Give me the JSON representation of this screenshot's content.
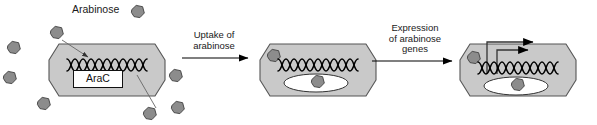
{
  "figure": {
    "legend_label": "Arabinose",
    "legend_marker": "hexagon-icon"
  },
  "colors": {
    "cell_fill": "#c9c9c9",
    "cell_stroke": "#555555",
    "molecule_fill": "#8c8c8c",
    "molecule_stroke": "#4a4a4a",
    "dna_stroke": "#000000",
    "protein_fill": "#ffffff",
    "text": "#1a1a1a",
    "arrow": "#000000",
    "leader_line": "#666666",
    "background": "#ffffff"
  },
  "steps": [
    {
      "id": "step-1",
      "arrow_label": "",
      "cell": {
        "dna": "dna-helix-icon",
        "protein_label": "AraC",
        "protein_bound": false,
        "transcription": false
      }
    },
    {
      "id": "step-2",
      "arrow_label": "Uptake of\narabinose",
      "arrow_label_lines": [
        "Uptake of",
        "arabinose"
      ],
      "cell": {
        "dna": "dna-helix-icon",
        "protein_label": "",
        "protein_bound": true,
        "transcription": false
      }
    },
    {
      "id": "step-3",
      "arrow_label": "Expression\nof arabinose\ngenes",
      "arrow_label_lines": [
        "Expression",
        "of arabinose",
        "genes"
      ],
      "cell": {
        "dna": "dna-helix-icon",
        "protein_label": "",
        "protein_bound": true,
        "transcription": true
      }
    }
  ],
  "molecules": {
    "name": "arabinose-molecule",
    "shape": "hexagon",
    "extracellular_count_cell1": 7,
    "intracellular_count_cell2": 2,
    "intracellular_count_cell3": 2
  }
}
